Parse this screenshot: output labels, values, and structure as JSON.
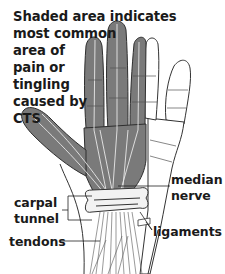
{
  "figure": {
    "caption": {
      "lines": [
        "Shaded area indicates",
        "most common",
        "area of",
        "pain or",
        "tingling",
        "caused by",
        "CTS"
      ]
    },
    "labels": {
      "median_nerve": [
        "median",
        "nerve"
      ],
      "carpal_tunnel": [
        "carpal",
        "tunnel"
      ],
      "ligaments": [
        "ligaments"
      ],
      "tendons": [
        "tendons"
      ]
    },
    "colors": {
      "shaded_area": "#7a7a7a",
      "outline": "#333333",
      "text": "#1a1a1a",
      "background": "#ffffff",
      "nerve_lines": "#e8e8e8"
    }
  }
}
